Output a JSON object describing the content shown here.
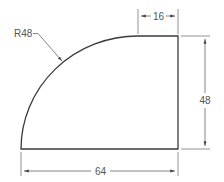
{
  "drawing": {
    "type": "engineering-dimensioned-profile",
    "shape": "quarter-round-with-flat",
    "colors": {
      "outline": "#3a3a3a",
      "dimension": "#666666",
      "text": "#555555",
      "background": "#ffffff"
    },
    "dimensions": {
      "radius_label": "R48",
      "top_flat_label": "16",
      "height_label": "48",
      "width_label": "64"
    }
  }
}
